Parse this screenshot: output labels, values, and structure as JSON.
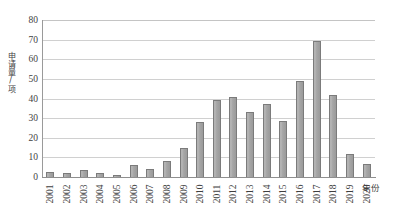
{
  "chart_data": {
    "type": "bar",
    "title": "",
    "xlabel": "年份",
    "ylabel": "申请量/项",
    "categories": [
      "2001",
      "2002",
      "2003",
      "2004",
      "2005",
      "2006",
      "2007",
      "2008",
      "2009",
      "2010",
      "2011",
      "2012",
      "2013",
      "2014",
      "2015",
      "2016",
      "2017",
      "2018",
      "2019",
      "2020"
    ],
    "values": [
      2.5,
      2,
      3.5,
      2,
      1,
      6,
      4,
      8,
      15,
      28,
      39,
      41,
      33,
      37,
      28.5,
      49,
      69.5,
      42,
      11.5,
      6.5
    ],
    "ylim": [
      0,
      80
    ],
    "ytick_step": 10,
    "yticks": [
      "0",
      "10",
      "20",
      "30",
      "40",
      "50",
      "60",
      "70",
      "80"
    ],
    "grid": true,
    "legend": false,
    "series_name": "申请量",
    "bar_color": "#a8a8a8",
    "bar_border_color": "#7b7b7b",
    "gridline_color": "#d0d0d0",
    "axis_color": "#8f8f8f",
    "text_color": "#3f3f3f"
  }
}
